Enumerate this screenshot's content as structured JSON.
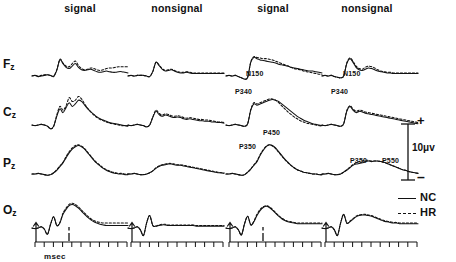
{
  "figure": {
    "type": "erp-waveform-grid",
    "columns": [
      {
        "label": "signal"
      },
      {
        "label": "nonsignal"
      },
      {
        "label": "signal"
      },
      {
        "label": "nonsignal"
      }
    ],
    "rows": [
      {
        "label": "F",
        "subscript": "z"
      },
      {
        "label": "C",
        "subscript": "z"
      },
      {
        "label": "P",
        "subscript": "z"
      },
      {
        "label": "O",
        "subscript": "z"
      }
    ]
  },
  "annotations": [
    {
      "text": "N150",
      "row": "Fz",
      "column": 2,
      "left": 246,
      "top": 70
    },
    {
      "text": "N150",
      "row": "Fz",
      "column": 3,
      "left": 343,
      "top": 70
    },
    {
      "text": "P340",
      "row": "Cz",
      "column": 2,
      "left": 235,
      "top": 88
    },
    {
      "text": "P340",
      "row": "Cz",
      "column": 3,
      "left": 331,
      "top": 88
    },
    {
      "text": "P350",
      "row": "Pz",
      "column": 2,
      "left": 239,
      "top": 143
    },
    {
      "text": "P450",
      "row": "Pz",
      "column": 2,
      "left": 263,
      "top": 129
    },
    {
      "text": "P350",
      "row": "Pz",
      "column": 3,
      "left": 350,
      "top": 157
    },
    {
      "text": "P550",
      "row": "Pz",
      "column": 3,
      "left": 382,
      "top": 157
    }
  ],
  "calibration": {
    "value": "10",
    "unit": "μv",
    "text": "10μv",
    "positive_sign": "+",
    "negative_sign": "–"
  },
  "legend": {
    "items": [
      {
        "label": "NC",
        "style": "solid"
      },
      {
        "label": "HR",
        "style": "dashed"
      }
    ]
  },
  "axis": {
    "caption": "msec",
    "tick_count": 10,
    "onset_marker": "stimulus-onset-arrow",
    "response_marker": "response-marker"
  },
  "colors": {
    "ink": "#111111",
    "background": "#ffffff"
  },
  "chart_data": {
    "type": "line",
    "title": "",
    "xlabel": "msec",
    "ylabel": "10μv",
    "series_names": [
      "NC",
      "HR"
    ],
    "panels": [
      {
        "row": "Fz",
        "column": "signal",
        "block": 1,
        "NC": [
          0,
          -1,
          1,
          0,
          -1,
          -2,
          -1,
          1,
          -9,
          -26,
          -20,
          -14,
          -12,
          -16,
          -20,
          -14,
          -10,
          -9,
          -10,
          -11,
          -9,
          -7,
          -6,
          -7,
          -8,
          -7,
          -6,
          -6,
          -7,
          -7,
          -6,
          -5
        ],
        "HR": [
          0,
          -1,
          0,
          -1,
          -2,
          -2,
          -1,
          0,
          -10,
          -27,
          -21,
          -16,
          -15,
          -20,
          -24,
          -17,
          -12,
          -10,
          -11,
          -13,
          -12,
          -10,
          -9,
          -10,
          -12,
          -13,
          -13,
          -14,
          -15,
          -15,
          -15,
          -15
        ]
      },
      {
        "row": "Fz",
        "column": "nonsignal",
        "block": 1,
        "NC": [
          0,
          -1,
          0,
          -1,
          -1,
          -1,
          0,
          1,
          -7,
          -22,
          -17,
          -11,
          -8,
          -9,
          -10,
          -8,
          -6,
          -5,
          -5,
          -6,
          -5,
          -4,
          -4,
          -4,
          -4,
          -4,
          -4,
          -4,
          -4,
          -4,
          -4,
          -4
        ],
        "HR": [
          0,
          -1,
          0,
          -1,
          -1,
          -1,
          0,
          1,
          -7,
          -22,
          -18,
          -12,
          -9,
          -10,
          -11,
          -9,
          -7,
          -6,
          -6,
          -7,
          -6,
          -5,
          -5,
          -5,
          -5,
          -5,
          -5,
          -5,
          -5,
          -5,
          -5,
          -5
        ]
      },
      {
        "row": "Fz",
        "column": "signal",
        "block": 2,
        "NC": [
          0,
          -1,
          0,
          -1,
          1,
          3,
          5,
          2,
          -22,
          -30,
          -28,
          -26,
          -25,
          -24,
          -23,
          -22,
          -21,
          -19,
          -18,
          -17,
          -16,
          -14,
          -13,
          -12,
          -11,
          -10,
          -9,
          -8,
          -8,
          -7,
          -6,
          -5
        ],
        "HR": [
          0,
          -1,
          0,
          -1,
          1,
          3,
          5,
          2,
          -23,
          -31,
          -30,
          -29,
          -28,
          -28,
          -27,
          -26,
          -24,
          -22,
          -20,
          -18,
          -16,
          -14,
          -12,
          -11,
          -10,
          -8,
          -7,
          -6,
          -5,
          -4,
          -3,
          -2
        ]
      },
      {
        "row": "Fz",
        "column": "nonsignal",
        "block": 2,
        "NC": [
          0,
          -1,
          0,
          -1,
          1,
          2,
          3,
          0,
          -20,
          -28,
          -22,
          -14,
          -10,
          -9,
          -11,
          -13,
          -12,
          -10,
          -8,
          -7,
          -6,
          -5,
          -5,
          -4,
          -4,
          -4,
          -4,
          -4,
          -4,
          -4,
          -4,
          -4
        ],
        "HR": [
          0,
          -1,
          0,
          -1,
          1,
          2,
          3,
          0,
          -21,
          -29,
          -24,
          -16,
          -12,
          -11,
          -14,
          -16,
          -15,
          -13,
          -10,
          -8,
          -7,
          -6,
          -6,
          -5,
          -5,
          -5,
          -5,
          -5,
          -5,
          -5,
          -5,
          -5
        ]
      },
      {
        "row": "Cz",
        "column": "signal",
        "block": 1,
        "NC": [
          0,
          1,
          0,
          -1,
          0,
          2,
          6,
          2,
          -14,
          -26,
          -20,
          -28,
          -36,
          -30,
          -34,
          -40,
          -38,
          -32,
          -26,
          -21,
          -17,
          -13,
          -10,
          -8,
          -6,
          -4,
          -3,
          -2,
          -1,
          0,
          1,
          1
        ],
        "HR": [
          0,
          1,
          0,
          -1,
          0,
          2,
          6,
          2,
          -16,
          -30,
          -24,
          -31,
          -44,
          -38,
          -40,
          -46,
          -42,
          -34,
          -27,
          -21,
          -16,
          -12,
          -9,
          -7,
          -5,
          -3,
          -2,
          -1,
          0,
          1,
          1,
          2
        ]
      },
      {
        "row": "Cz",
        "column": "nonsignal",
        "block": 1,
        "NC": [
          0,
          1,
          0,
          -1,
          0,
          1,
          3,
          0,
          -12,
          -22,
          -17,
          -14,
          -16,
          -15,
          -13,
          -12,
          -13,
          -12,
          -10,
          -9,
          -10,
          -9,
          -8,
          -7,
          -7,
          -6,
          -6,
          -5,
          -5,
          -4,
          -4,
          -3
        ],
        "HR": [
          0,
          1,
          0,
          -1,
          0,
          1,
          3,
          0,
          -13,
          -24,
          -19,
          -16,
          -18,
          -17,
          -15,
          -14,
          -15,
          -14,
          -12,
          -11,
          -12,
          -11,
          -10,
          -9,
          -9,
          -8,
          -8,
          -7,
          -6,
          -5,
          -5,
          -4
        ]
      },
      {
        "row": "Cz",
        "column": "signal",
        "block": 2,
        "NC": [
          0,
          1,
          0,
          -1,
          0,
          1,
          2,
          -2,
          -24,
          -34,
          -32,
          -34,
          -36,
          -38,
          -40,
          -41,
          -40,
          -38,
          -34,
          -30,
          -26,
          -22,
          -18,
          -14,
          -11,
          -8,
          -6,
          -4,
          -2,
          -1,
          0,
          1
        ],
        "HR": [
          0,
          1,
          0,
          -1,
          0,
          1,
          2,
          -2,
          -25,
          -36,
          -34,
          -36,
          -38,
          -40,
          -42,
          -42,
          -40,
          -36,
          -31,
          -26,
          -21,
          -17,
          -13,
          -10,
          -7,
          -5,
          -3,
          -2,
          -1,
          0,
          1,
          2
        ]
      },
      {
        "row": "Cz",
        "column": "nonsignal",
        "block": 2,
        "NC": [
          0,
          1,
          0,
          -1,
          0,
          1,
          2,
          -2,
          -22,
          -30,
          -24,
          -20,
          -22,
          -21,
          -19,
          -18,
          -17,
          -16,
          -15,
          -14,
          -13,
          -12,
          -11,
          -10,
          -9,
          -8,
          -7,
          -6,
          -5,
          -4,
          -3,
          -2
        ],
        "HR": [
          0,
          1,
          0,
          -1,
          0,
          1,
          2,
          -2,
          -23,
          -31,
          -26,
          -22,
          -24,
          -23,
          -21,
          -20,
          -19,
          -18,
          -17,
          -16,
          -15,
          -14,
          -13,
          -12,
          -11,
          -10,
          -9,
          -8,
          -7,
          -6,
          -5,
          -4
        ]
      },
      {
        "row": "Pz",
        "column": "signal",
        "block": 1,
        "NC": [
          0,
          0,
          -1,
          0,
          1,
          2,
          1,
          -2,
          -6,
          -12,
          -18,
          -26,
          -34,
          -40,
          -44,
          -46,
          -44,
          -40,
          -34,
          -28,
          -22,
          -17,
          -13,
          -9,
          -6,
          -4,
          -2,
          -1,
          0,
          0,
          1,
          1
        ],
        "HR": [
          0,
          0,
          -1,
          0,
          1,
          2,
          1,
          -2,
          -7,
          -13,
          -19,
          -28,
          -36,
          -42,
          -46,
          -47,
          -45,
          -41,
          -35,
          -29,
          -23,
          -18,
          -14,
          -10,
          -7,
          -5,
          -3,
          -2,
          -1,
          -1,
          0,
          0
        ]
      },
      {
        "row": "Pz",
        "column": "nonsignal",
        "block": 1,
        "NC": [
          0,
          0,
          -1,
          0,
          1,
          1,
          0,
          -2,
          -5,
          -9,
          -12,
          -14,
          -15,
          -16,
          -16,
          -15,
          -14,
          -14,
          -13,
          -12,
          -11,
          -10,
          -9,
          -8,
          -7,
          -6,
          -5,
          -4,
          -3,
          -2,
          -2,
          -1
        ],
        "HR": [
          0,
          0,
          -1,
          0,
          1,
          1,
          0,
          -2,
          -5,
          -10,
          -13,
          -15,
          -16,
          -17,
          -17,
          -16,
          -15,
          -15,
          -14,
          -13,
          -12,
          -11,
          -10,
          -9,
          -8,
          -7,
          -6,
          -5,
          -4,
          -3,
          -2,
          -2
        ]
      },
      {
        "row": "Pz",
        "column": "signal",
        "block": 2,
        "NC": [
          0,
          0,
          -1,
          0,
          1,
          2,
          1,
          -3,
          -8,
          -14,
          -20,
          -30,
          -38,
          -44,
          -47,
          -46,
          -42,
          -36,
          -30,
          -24,
          -19,
          -14,
          -10,
          -7,
          -5,
          -3,
          -2,
          -1,
          0,
          0,
          1,
          1
        ],
        "HR": [
          0,
          0,
          -1,
          0,
          1,
          2,
          1,
          -3,
          -8,
          -15,
          -21,
          -31,
          -39,
          -45,
          -47,
          -45,
          -41,
          -35,
          -29,
          -23,
          -18,
          -14,
          -10,
          -7,
          -5,
          -3,
          -2,
          -1,
          0,
          0,
          1,
          1
        ]
      },
      {
        "row": "Pz",
        "column": "nonsignal",
        "block": 2,
        "NC": [
          0,
          0,
          -1,
          0,
          1,
          1,
          0,
          -3,
          -6,
          -10,
          -14,
          -16,
          -17,
          -18,
          -20,
          -21,
          -20,
          -21,
          -21,
          -20,
          -19,
          -17,
          -15,
          -13,
          -11,
          -9,
          -7,
          -6,
          -4,
          -3,
          -2,
          -1
        ],
        "HR": [
          0,
          0,
          -1,
          0,
          1,
          1,
          0,
          -3,
          -7,
          -11,
          -15,
          -18,
          -20,
          -21,
          -22,
          -22,
          -21,
          -21,
          -21,
          -20,
          -19,
          -17,
          -15,
          -13,
          -11,
          -9,
          -7,
          -6,
          -4,
          -3,
          -2,
          -1
        ]
      },
      {
        "row": "Oz",
        "column": "signal",
        "block": 1,
        "NC": [
          0,
          1,
          0,
          -2,
          2,
          10,
          -6,
          -18,
          -4,
          -8,
          -22,
          -30,
          -36,
          -38,
          -36,
          -32,
          -27,
          -22,
          -17,
          -13,
          -10,
          -8,
          -6,
          -5,
          -4,
          -4,
          -4,
          -4,
          -4,
          -4,
          -4,
          -4
        ],
        "HR": [
          0,
          1,
          0,
          -2,
          2,
          10,
          -6,
          -18,
          -4,
          -9,
          -24,
          -32,
          -38,
          -40,
          -38,
          -34,
          -29,
          -24,
          -19,
          -15,
          -12,
          -10,
          -9,
          -8,
          -8,
          -8,
          -8,
          -8,
          -8,
          -8,
          -8,
          -8
        ]
      },
      {
        "row": "Oz",
        "column": "nonsignal",
        "block": 1,
        "NC": [
          0,
          1,
          0,
          -2,
          3,
          12,
          -8,
          -20,
          -4,
          -3,
          -4,
          -5,
          -5,
          -4,
          -4,
          -4,
          -4,
          -4,
          -4,
          -4,
          -4,
          -4,
          -3,
          -3,
          -3,
          -3,
          -3,
          -3,
          -3,
          -3,
          -3,
          -3
        ],
        "HR": [
          0,
          1,
          0,
          -2,
          3,
          12,
          -8,
          -20,
          -4,
          -3,
          -5,
          -6,
          -6,
          -5,
          -5,
          -5,
          -5,
          -5,
          -5,
          -5,
          -5,
          -5,
          -4,
          -4,
          -4,
          -4,
          -4,
          -4,
          -4,
          -4,
          -4,
          -4
        ]
      },
      {
        "row": "Oz",
        "column": "signal",
        "block": 2,
        "NC": [
          0,
          1,
          0,
          -2,
          3,
          11,
          -7,
          -19,
          -5,
          -10,
          -20,
          -28,
          -33,
          -35,
          -33,
          -29,
          -24,
          -19,
          -15,
          -12,
          -10,
          -9,
          -8,
          -7,
          -7,
          -7,
          -7,
          -7,
          -7,
          -7,
          -7,
          -7
        ],
        "HR": [
          0,
          1,
          0,
          -2,
          3,
          11,
          -7,
          -19,
          -5,
          -11,
          -22,
          -30,
          -34,
          -36,
          -34,
          -30,
          -25,
          -20,
          -16,
          -13,
          -11,
          -10,
          -9,
          -8,
          -8,
          -8,
          -8,
          -8,
          -8,
          -8,
          -8,
          -8
        ]
      },
      {
        "row": "Oz",
        "column": "nonsignal",
        "block": 2,
        "NC": [
          0,
          1,
          0,
          -2,
          3,
          12,
          -8,
          -22,
          -8,
          -10,
          -14,
          -18,
          -20,
          -21,
          -21,
          -20,
          -19,
          -17,
          -15,
          -13,
          -11,
          -10,
          -9,
          -8,
          -8,
          -7,
          -7,
          -7,
          -7,
          -7,
          -7,
          -7
        ],
        "HR": [
          0,
          1,
          0,
          -2,
          3,
          12,
          -8,
          -22,
          -8,
          -11,
          -15,
          -19,
          -21,
          -22,
          -22,
          -21,
          -20,
          -18,
          -16,
          -14,
          -12,
          -11,
          -10,
          -9,
          -9,
          -8,
          -8,
          -8,
          -8,
          -8,
          -8,
          -8
        ]
      }
    ]
  }
}
